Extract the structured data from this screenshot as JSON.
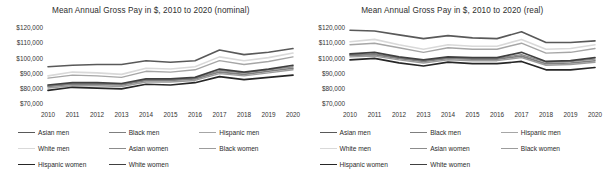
{
  "charts": [
    {
      "id": "nominal",
      "title": "Mean Annual Gross Pay in $, 2010 to 2020 (nominal)"
    },
    {
      "id": "real",
      "title": "Mean Annual Gross Pay in $, 2010 to 2020 (real)"
    }
  ],
  "legend": {
    "items": [
      {
        "label": "Asian men",
        "color": "#595959",
        "width": 1.6
      },
      {
        "label": "Black men",
        "color": "#7f7f7f",
        "width": 1.6
      },
      {
        "label": "Hispanic men",
        "color": "#a6a6a6",
        "width": 1.4
      },
      {
        "label": "White men",
        "color": "#d9d9d9",
        "width": 1.6
      },
      {
        "label": "Asian women",
        "color": "#8c8c8c",
        "width": 1.4
      },
      {
        "label": "Black women",
        "color": "#9c9c9c",
        "width": 1.4
      },
      {
        "label": "Hispanic women",
        "color": "#262626",
        "width": 1.7
      },
      {
        "label": "White women",
        "color": "#404040",
        "width": 1.7
      }
    ]
  },
  "chart_data": [
    {
      "type": "line",
      "title": "Mean Annual Gross Pay in $, 2010 to 2020 (nominal)",
      "xlabel": "",
      "ylabel": "",
      "grid": false,
      "legend_position": "bottom",
      "x": [
        2010,
        2011,
        2012,
        2013,
        2014,
        2015,
        2016,
        2017,
        2018,
        2019,
        2020
      ],
      "xtick_labels": [
        "2010",
        "2011",
        "2012",
        "2013",
        "2014",
        "2015",
        "2016",
        "2017",
        "2018",
        "2019",
        "2020"
      ],
      "ytick_labels": [
        "$120,000",
        "$110,000",
        "$100,000",
        "$90,000",
        "$80,000",
        "$70,000"
      ],
      "yticks": [
        120000,
        110000,
        100000,
        90000,
        80000,
        70000
      ],
      "ylim": [
        70000,
        120000
      ],
      "series": [
        {
          "name": "Asian men",
          "values": [
            94500,
            95500,
            96000,
            96000,
            98500,
            97500,
            98500,
            105500,
            102500,
            104000,
            106500
          ]
        },
        {
          "name": "Black men",
          "values": [
            81500,
            83000,
            83000,
            82500,
            85500,
            85500,
            86500,
            91000,
            89500,
            91500,
            93500
          ]
        },
        {
          "name": "Hispanic men",
          "values": [
            87000,
            89000,
            88500,
            87500,
            91500,
            91000,
            92500,
            98500,
            96000,
            98000,
            101000
          ]
        },
        {
          "name": "White men",
          "values": [
            88500,
            91000,
            90500,
            89500,
            93500,
            93000,
            94500,
            101000,
            98500,
            100500,
            103500
          ]
        },
        {
          "name": "Asian women",
          "values": [
            82000,
            83500,
            83500,
            83000,
            86000,
            86000,
            87000,
            92000,
            90500,
            92500,
            94500
          ]
        },
        {
          "name": "Black women",
          "values": [
            80500,
            82000,
            82000,
            81500,
            84500,
            84500,
            85500,
            90000,
            88500,
            90500,
            92500
          ]
        },
        {
          "name": "Hispanic women",
          "values": [
            79000,
            81000,
            80500,
            80000,
            83000,
            82500,
            84000,
            88000,
            86000,
            87500,
            89000
          ]
        },
        {
          "name": "White women",
          "values": [
            82500,
            84000,
            84000,
            83500,
            86500,
            86500,
            87500,
            93000,
            91000,
            93000,
            95500
          ]
        }
      ]
    },
    {
      "type": "line",
      "title": "Mean Annual Gross Pay in $, 2010 to 2020 (real)",
      "xlabel": "",
      "ylabel": "",
      "grid": false,
      "legend_position": "bottom",
      "x": [
        2010,
        2011,
        2012,
        2013,
        2014,
        2015,
        2016,
        2017,
        2018,
        2019,
        2020
      ],
      "xtick_labels": [
        "2010",
        "2011",
        "2012",
        "2013",
        "2014",
        "2015",
        "2016",
        "2017",
        "2018",
        "2019",
        "2020"
      ],
      "ytick_labels": [
        "$120,000",
        "$110,000",
        "$100,000",
        "$90,000",
        "$80,000",
        "$70,000"
      ],
      "yticks": [
        120000,
        110000,
        100000,
        90000,
        80000,
        70000
      ],
      "ylim": [
        70000,
        120000
      ],
      "series": [
        {
          "name": "Asian men",
          "values": [
            118500,
            118000,
            115500,
            113000,
            115000,
            113500,
            113000,
            117500,
            110500,
            110500,
            111500
          ]
        },
        {
          "name": "Black men",
          "values": [
            102000,
            102500,
            100000,
            98000,
            100000,
            99500,
            99500,
            101500,
            96500,
            97000,
            98500
          ]
        },
        {
          "name": "Hispanic men",
          "values": [
            109000,
            110000,
            107000,
            104000,
            107000,
            106000,
            106000,
            110000,
            103500,
            104000,
            106500
          ]
        },
        {
          "name": "White men",
          "values": [
            111000,
            112500,
            109000,
            106000,
            109000,
            108000,
            108000,
            112500,
            106000,
            106500,
            109000
          ]
        },
        {
          "name": "Asian women",
          "values": [
            102500,
            103000,
            100500,
            98500,
            100500,
            100000,
            100000,
            102500,
            97500,
            98000,
            99500
          ]
        },
        {
          "name": "Black women",
          "values": [
            101000,
            101500,
            99000,
            97000,
            99000,
            98500,
            98500,
            100500,
            95500,
            96000,
            97500
          ]
        },
        {
          "name": "Hispanic women",
          "values": [
            99000,
            100000,
            97000,
            95000,
            97500,
            96500,
            96500,
            98000,
            92500,
            92500,
            94000
          ]
        },
        {
          "name": "White women",
          "values": [
            103000,
            104000,
            101000,
            99000,
            101000,
            100500,
            100500,
            104000,
            98000,
            98500,
            100500
          ]
        }
      ]
    }
  ]
}
